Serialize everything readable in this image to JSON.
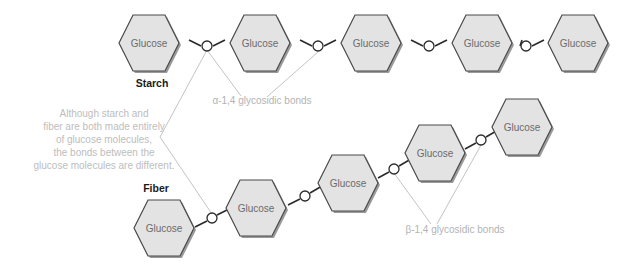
{
  "figure": {
    "type": "diagram",
    "background_color": "#ffffff"
  },
  "colors": {
    "hexagon_fill": "#e3e3e3",
    "hexagon_stroke": "#4a4a4a",
    "hexagon_shadow": "#9a9a9a",
    "hexagon_text": "#6b6b6b",
    "chain_label_text": "#1a1a1a",
    "bond_line": "#2b2b2b",
    "bond_circle_fill": "#ffffff",
    "leader_line": "#c4c4c4",
    "bond_label_text": "#b3b3b3",
    "caption_text": "#bdbdbd"
  },
  "caption": {
    "lines": [
      "Although starch and",
      "fiber are both made entirely",
      "of glucose molecules,",
      "the bonds between the",
      "glucose molecules are different."
    ]
  },
  "chains": [
    {
      "id": "starch",
      "name": "Starch",
      "bond_label": "α-1,4 glycosidic bonds",
      "monomer_label": "Glucose",
      "monomer_count": 5,
      "arrangement": "horizontal",
      "units": [
        {
          "label": "Glucose",
          "cx": 151,
          "cy": 43
        },
        {
          "label": "Glucose",
          "cx": 262,
          "cy": 43
        },
        {
          "label": "Glucose",
          "cx": 373,
          "cy": 43
        },
        {
          "label": "Glucose",
          "cx": 484,
          "cy": 43
        },
        {
          "label": "Glucose",
          "cx": 580,
          "cy": 43
        }
      ],
      "bonds": [
        {
          "cx": 207,
          "cy": 46
        },
        {
          "cx": 318,
          "cy": 46
        },
        {
          "cx": 429,
          "cy": 46
        },
        {
          "cx": 526,
          "cy": 46
        }
      ]
    },
    {
      "id": "fiber",
      "name": "Fiber",
      "bond_label": "β-1,4 glycosidic bonds",
      "monomer_label": "Glucose",
      "monomer_count": 5,
      "arrangement": "ascending-staircase",
      "units": [
        {
          "label": "Glucose",
          "cx": 166,
          "cy": 228
        },
        {
          "label": "Glucose",
          "cx": 258,
          "cy": 208
        },
        {
          "label": "Glucose",
          "cx": 351,
          "cy": 183
        },
        {
          "label": "Glucose",
          "cx": 437,
          "cy": 153
        },
        {
          "label": "Glucose",
          "cx": 524,
          "cy": 127
        }
      ],
      "bonds": [
        {
          "cx": 212,
          "cy": 218
        },
        {
          "cx": 305,
          "cy": 196
        },
        {
          "cx": 394,
          "cy": 169
        },
        {
          "cx": 481,
          "cy": 140
        }
      ]
    }
  ],
  "annotations": {
    "alpha_label": {
      "text": "α-1,4 glycosidic bonds",
      "x": 262,
      "y": 101
    },
    "beta_label": {
      "text": "β-1,4 glycosidic bonds",
      "x": 455,
      "y": 230
    },
    "starch_name": {
      "text": "Starch",
      "x": 152,
      "y": 83
    },
    "fiber_name": {
      "text": "Fiber",
      "x": 156,
      "y": 188
    }
  }
}
